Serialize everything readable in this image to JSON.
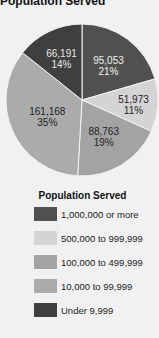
{
  "title": "Population Served",
  "chart_data": {
    "type": "pie",
    "title": "Population Served",
    "start_angle": "12 o'clock, clockwise",
    "slices": [
      {
        "category": "1,000,000 or more",
        "value": 95053,
        "value_label": "95,053",
        "percent": 21,
        "percent_label": "21%",
        "color": "#505050",
        "text_color": "#f0f0f0"
      },
      {
        "category": "500,000 to 999,999",
        "value": 51973,
        "value_label": "51,973",
        "percent": 11,
        "percent_label": "11%",
        "color": "#d4d4d4",
        "text_color": "#222222"
      },
      {
        "category": "100,000 to 499,999",
        "value": 88763,
        "value_label": "88,763",
        "percent": 19,
        "percent_label": "19%",
        "color": "#a3a3a3",
        "text_color": "#222222"
      },
      {
        "category": "10,000 to 99,999",
        "value": 161168,
        "value_label": "161,168",
        "percent": 35,
        "percent_label": "35%",
        "color": "#ababab",
        "text_color": "#222222"
      },
      {
        "category": "Under 9,999",
        "value": 66191,
        "value_label": "66,191",
        "percent": 14,
        "percent_label": "14%",
        "color": "#3f3f3f",
        "text_color": "#e8e8e8"
      }
    ],
    "legend": {
      "title": "Population Served",
      "position": "below",
      "entries": [
        {
          "label": "1,000,000 or more",
          "color": "#505050"
        },
        {
          "label": "500,000 to 999,999",
          "color": "#d4d4d4"
        },
        {
          "label": "100,000 to 499,999",
          "color": "#a3a3a3"
        },
        {
          "label": "10,000 to 99,999",
          "color": "#ababab"
        },
        {
          "label": "Under 9,999",
          "color": "#3f3f3f"
        }
      ]
    }
  }
}
